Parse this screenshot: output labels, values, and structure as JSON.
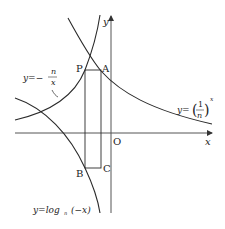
{
  "diagram": {
    "axes": {
      "x_label": "x",
      "y_label": "y",
      "origin_label": "O"
    },
    "points": {
      "P": "P",
      "A": "A",
      "B": "B",
      "C": "C"
    },
    "curves": {
      "exp": {
        "lhs": "y=",
        "num": "1",
        "den": "n",
        "exp": "x"
      },
      "hyperbola": {
        "lhs": "y=−",
        "num": "n",
        "den": "x"
      },
      "log": {
        "text_prefix": "y=log",
        "base": "n",
        "arg": "(−x)"
      }
    },
    "colors": {
      "stroke": "#2a2a2a",
      "axis": "#555555"
    }
  }
}
